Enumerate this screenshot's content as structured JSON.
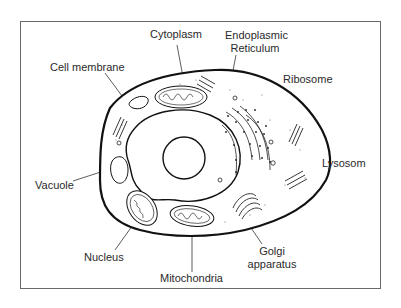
{
  "diagram": {
    "title": "",
    "type": "animal cell diagram",
    "labels": {
      "cell_membrane": "Cell membrane",
      "cytoplasm": "Cytoplasm",
      "er_line1": "Endoplasmic",
      "er_line2": "Reticulum",
      "ribosome": "Ribosome",
      "lysosome": "Lysosom",
      "vacuole": "Vacuole",
      "nucleus": "Nucleus",
      "mitochondria": "Mitochondria",
      "golgi_line1": "Golgi",
      "golgi_line2": "apparatus"
    },
    "colors": {
      "stroke": "#1a1a1a",
      "text": "#2a2a2a",
      "frame": "#6a6a6a",
      "background": "#ffffff"
    }
  }
}
